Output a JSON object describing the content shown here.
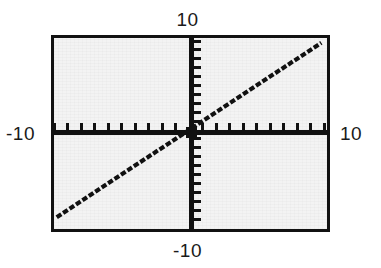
{
  "figure": {
    "name": "cartesian-plot",
    "background_color": "#ffffff",
    "plot_background_color": "#f3f3f3",
    "frame_color": "#111111",
    "axis_color": "#111111",
    "series_color": "#111111"
  },
  "labels": {
    "top": "10",
    "bottom": "-10",
    "left": "-10",
    "right": "10"
  },
  "chart_data": {
    "type": "line",
    "title": "",
    "xlabel": "",
    "ylabel": "",
    "xlim": [
      -10,
      10
    ],
    "ylim": [
      -10,
      10
    ],
    "grid": false,
    "legend": "none",
    "x_tick_labels": [
      "-10",
      "10"
    ],
    "y_tick_labels": [
      "-10",
      "10"
    ],
    "x_tick_count": 20,
    "y_tick_count": 20,
    "x_tick_step": 1,
    "y_tick_step": 1,
    "axis_style": "centered-crosshair",
    "series": [
      {
        "name": "y = x",
        "equation": "y = x",
        "slope": 1,
        "intercept": 0,
        "x": [
          -9.8,
          -7.5,
          -5,
          -2.5,
          0,
          2.5,
          5,
          7.5,
          9.8
        ],
        "values": [
          -9.8,
          -7.5,
          -5,
          -2.5,
          0,
          2.5,
          5,
          7.5,
          9.8
        ],
        "style": "solid-pixelated"
      }
    ]
  }
}
